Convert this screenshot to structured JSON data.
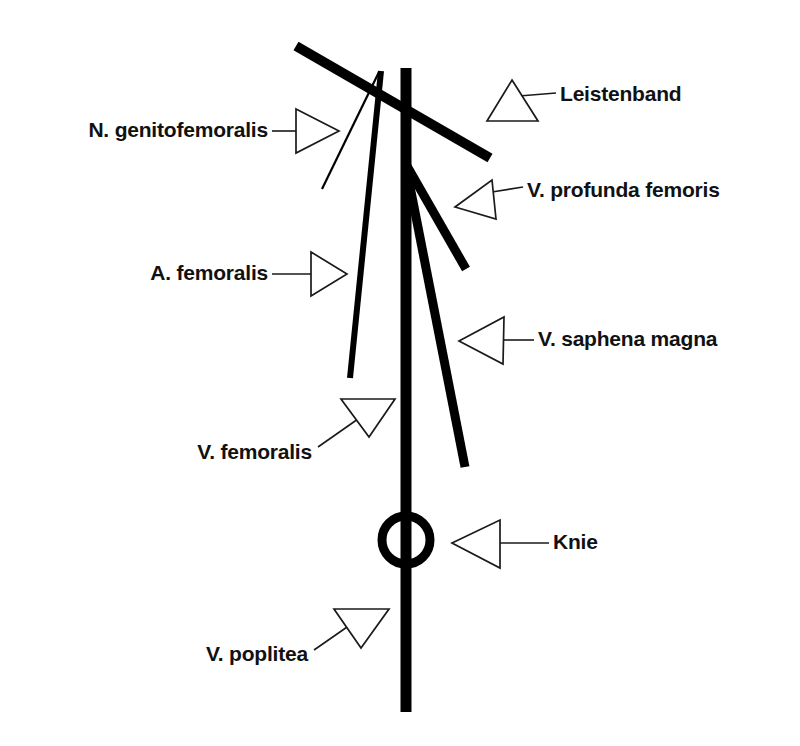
{
  "figure": {
    "background_color": "#ffffff",
    "ink_color": "#000000",
    "language": "de"
  },
  "labels": [
    {
      "id": "n-genitofemoralis",
      "text": "N. genitofemoralis",
      "text_anchor": "end",
      "text_x": 268,
      "text_y": 131,
      "arrow_direction": "right",
      "arrow_name": "arrow-right-icon",
      "arrow_points": "296,109 339,131 296,153",
      "leader": {
        "x1": 272,
        "y1": 131,
        "x2": 296,
        "y2": 131
      }
    },
    {
      "id": "leistenband",
      "text": "Leistenband",
      "text_anchor": "start",
      "text_x": 560,
      "text_y": 95,
      "arrow_direction": "up",
      "arrow_name": "arrow-up-icon",
      "arrow_points": "512,80 538,121 487,121",
      "leader": {
        "x1": 519,
        "y1": 96,
        "x2": 556,
        "y2": 93
      }
    },
    {
      "id": "v-profunda-femoris",
      "text": "V. profunda femoris",
      "text_anchor": "start",
      "text_x": 527,
      "text_y": 191,
      "arrow_direction": "left",
      "arrow_name": "arrow-left-icon",
      "arrow_points": "455,207 492,180 496,219",
      "leader": {
        "x1": 492,
        "y1": 192,
        "x2": 523,
        "y2": 187
      }
    },
    {
      "id": "a-femoralis",
      "text": "A. femoralis",
      "text_anchor": "end",
      "text_x": 268,
      "text_y": 274,
      "arrow_direction": "right",
      "arrow_name": "arrow-right-icon",
      "arrow_points": "311,252 347,274 311,296",
      "leader": {
        "x1": 272,
        "y1": 274,
        "x2": 311,
        "y2": 274
      }
    },
    {
      "id": "v-saphena-magna",
      "text": "V. saphena magna",
      "text_anchor": "start",
      "text_x": 538,
      "text_y": 340,
      "arrow_direction": "left",
      "arrow_name": "arrow-left-icon",
      "arrow_points": "459,341 504,317 503,364",
      "leader": {
        "x1": 504,
        "y1": 340,
        "x2": 534,
        "y2": 340
      }
    },
    {
      "id": "v-femoralis",
      "text": "V. femoralis",
      "text_anchor": "end",
      "text_x": 312,
      "text_y": 453,
      "arrow_direction": "down",
      "arrow_name": "arrow-down-icon",
      "arrow_points": "341,399 395,399 369,437",
      "leader": {
        "x1": 318,
        "y1": 447,
        "x2": 358,
        "y2": 419
      }
    },
    {
      "id": "knie",
      "text": "Knie",
      "text_anchor": "start",
      "text_x": 553,
      "text_y": 543,
      "arrow_direction": "left",
      "arrow_name": "arrow-left-icon",
      "arrow_points": "452,543 500,520 500,568",
      "leader": {
        "x1": 500,
        "y1": 543,
        "x2": 549,
        "y2": 543
      }
    },
    {
      "id": "v-poplitea",
      "text": "V. poplitea",
      "text_anchor": "end",
      "text_x": 308,
      "text_y": 655,
      "arrow_direction": "down",
      "arrow_name": "arrow-down-icon",
      "arrow_points": "334,609 389,609 361,648",
      "leader": {
        "x1": 314,
        "y1": 650,
        "x2": 350,
        "y2": 625
      }
    }
  ],
  "structures": [
    {
      "id": "leistenband-line",
      "name": "inguinal-ligament-line",
      "kind": "line",
      "x1": 296,
      "y1": 46,
      "x2": 490,
      "y2": 158,
      "stroke_width": 10
    },
    {
      "id": "v-femoralis-trunk",
      "name": "femoral-popliteal-vein-trunk",
      "kind": "line",
      "x1": 406,
      "y1": 68,
      "x2": 406,
      "y2": 712,
      "stroke_width": 11
    },
    {
      "id": "v-profunda-branch",
      "name": "deep-femoral-vein-branch",
      "kind": "line",
      "x1": 407,
      "y1": 166,
      "x2": 466,
      "y2": 269,
      "stroke_width": 9
    },
    {
      "id": "v-saphena-branch",
      "name": "great-saphenous-vein-branch",
      "kind": "line",
      "x1": 406,
      "y1": 166,
      "x2": 465,
      "y2": 467,
      "stroke_width": 9
    },
    {
      "id": "a-femoralis-line",
      "name": "femoral-artery-line",
      "kind": "line",
      "x1": 381,
      "y1": 71,
      "x2": 350,
      "y2": 378,
      "stroke_width": 6
    },
    {
      "id": "n-genitofemoralis-line",
      "name": "genitofemoral-nerve-line",
      "kind": "line",
      "x1": 379,
      "y1": 72,
      "x2": 322,
      "y2": 189,
      "stroke_width": 2.2
    },
    {
      "id": "knie-circle",
      "name": "knee-marker-circle",
      "kind": "circle",
      "cx": 406,
      "cy": 540,
      "r": 24,
      "stroke_width": 9
    }
  ]
}
